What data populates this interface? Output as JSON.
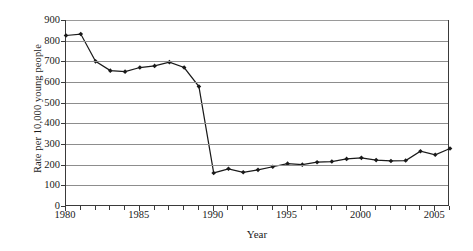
{
  "chart_data": {
    "type": "line",
    "title": "",
    "xlabel": "Year",
    "ylabel": "Rate per 10,000 young people",
    "xlim": [
      1980,
      2006
    ],
    "ylim": [
      0,
      900
    ],
    "ytick_labels": [
      "0",
      "100",
      "200",
      "300",
      "400",
      "500",
      "600",
      "700",
      "800",
      "900"
    ],
    "ytick_values": [
      0,
      100,
      200,
      300,
      400,
      500,
      600,
      700,
      800,
      900
    ],
    "xtick_labels": [
      "1980",
      "1985",
      "1990",
      "1995",
      "2000",
      "2005"
    ],
    "xtick_values": [
      1980,
      1985,
      1990,
      1995,
      2000,
      2005
    ],
    "grid": "horizontal",
    "legend": "none",
    "marker": "diamond",
    "line_color": "#1a1a1a",
    "grid_color": "#8d8d8d",
    "axis_color": "#3a3a3a",
    "x": [
      1980,
      1981,
      1982,
      1983,
      1984,
      1985,
      1986,
      1987,
      1988,
      1989,
      1990,
      1991,
      1992,
      1993,
      1994,
      1995,
      1996,
      1997,
      1998,
      1999,
      2000,
      2001,
      2002,
      2003,
      2004,
      2005,
      2006
    ],
    "values": [
      825,
      832,
      700,
      655,
      650,
      670,
      678,
      696,
      670,
      578,
      160,
      180,
      163,
      175,
      190,
      205,
      200,
      212,
      215,
      228,
      233,
      222,
      218,
      220,
      265,
      248,
      278
    ],
    "series": [
      {
        "name": "Rate per 10,000 young people",
        "values": [
          825,
          832,
          700,
          655,
          650,
          670,
          678,
          696,
          670,
          578,
          160,
          180,
          163,
          175,
          190,
          205,
          200,
          212,
          215,
          228,
          233,
          222,
          218,
          220,
          265,
          248,
          278
        ]
      }
    ]
  }
}
